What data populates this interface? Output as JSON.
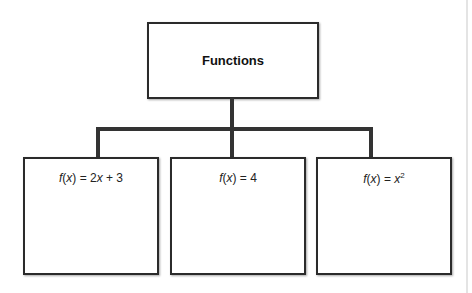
{
  "diagram": {
    "root": {
      "label": "Functions"
    },
    "children": [
      {
        "fn": "f",
        "var": "x",
        "rhs_parts": [
          "2",
          "x",
          " + 3"
        ],
        "display": "f(x) = 2x + 3"
      },
      {
        "fn": "f",
        "var": "x",
        "rhs_parts": [
          "4"
        ],
        "display": "f(x) = 4"
      },
      {
        "fn": "f",
        "var": "x",
        "rhs_parts": [
          "x"
        ],
        "exponent": "2",
        "display": "f(x) = x²"
      }
    ]
  }
}
